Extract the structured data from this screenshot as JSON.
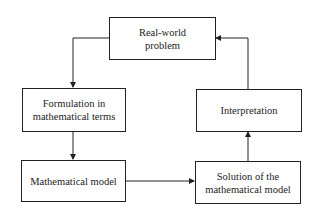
{
  "diagram": {
    "type": "flowchart-cycle",
    "nodes": [
      {
        "id": "real_world",
        "label_lines": [
          "Real-world",
          "problem"
        ]
      },
      {
        "id": "formulation",
        "label_lines": [
          "Formulation in",
          "mathematical terms"
        ]
      },
      {
        "id": "math_model",
        "label_lines": [
          "Mathematical model"
        ]
      },
      {
        "id": "solution",
        "label_lines": [
          "Solution of the",
          "mathematical model"
        ]
      },
      {
        "id": "interpretation",
        "label_lines": [
          "Interpretation"
        ]
      }
    ],
    "edges": [
      {
        "from": "real_world",
        "to": "formulation"
      },
      {
        "from": "formulation",
        "to": "math_model"
      },
      {
        "from": "math_model",
        "to": "solution"
      },
      {
        "from": "solution",
        "to": "interpretation"
      },
      {
        "from": "interpretation",
        "to": "real_world"
      }
    ]
  }
}
